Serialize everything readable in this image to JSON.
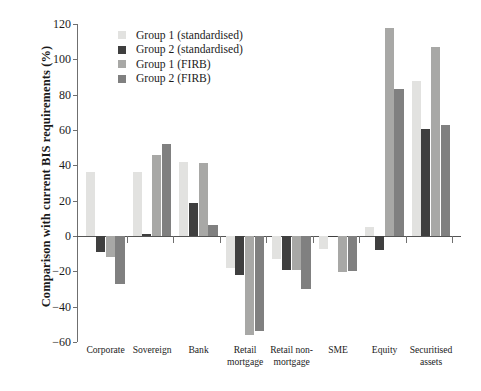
{
  "chart_data": {
    "type": "bar",
    "title": "",
    "xlabel": "",
    "ylabel": "Comparison with current BIS requirements (%)",
    "ylim": [
      -60,
      120
    ],
    "yticks": [
      -60,
      -40,
      -20,
      0,
      20,
      40,
      60,
      80,
      100,
      120
    ],
    "ytick_labels": [
      "−60",
      "−40",
      "−20",
      "0",
      "20",
      "40",
      "60",
      "80",
      "100",
      "120"
    ],
    "grid": false,
    "legend_position": "top-left-inside",
    "categories": [
      "Corporate",
      "Sovereign",
      "Bank",
      "Retail\nmortgage",
      "Retail non-\nmortgage",
      "SME",
      "Equity",
      "Securitised\nassets"
    ],
    "series": [
      {
        "name": "Group 1 (standardised)",
        "color": "#e2e2e0",
        "values": [
          36,
          36,
          42,
          -18,
          -13,
          -7.5,
          5,
          88
        ]
      },
      {
        "name": "Group 2 (standardised)",
        "color": "#3f3f3f",
        "values": [
          -9,
          1,
          18.5,
          -22,
          -19,
          0,
          -8,
          60.5
        ]
      },
      {
        "name": "Group 1 (FIRB)",
        "color": "#a8a8a6",
        "values": [
          -12,
          46,
          41.5,
          -56,
          -19.5,
          -20.5,
          118,
          107
        ]
      },
      {
        "name": "Group 2 (FIRB)",
        "color": "#808080",
        "values": [
          -27,
          52,
          6,
          -54,
          -30,
          -20,
          83,
          63
        ]
      }
    ]
  },
  "legend": {
    "items": [
      {
        "label": "Group 1 (standardised)",
        "color": "#e2e2e0"
      },
      {
        "label": "Group 2 (standardised)",
        "color": "#3f3f3f"
      },
      {
        "label": "Group 1 (FIRB)",
        "color": "#a8a8a6"
      },
      {
        "label": "Group 2 (FIRB)",
        "color": "#808080"
      }
    ]
  },
  "axis": {
    "y_title": "Comparison with current BIS requirements (%)"
  }
}
